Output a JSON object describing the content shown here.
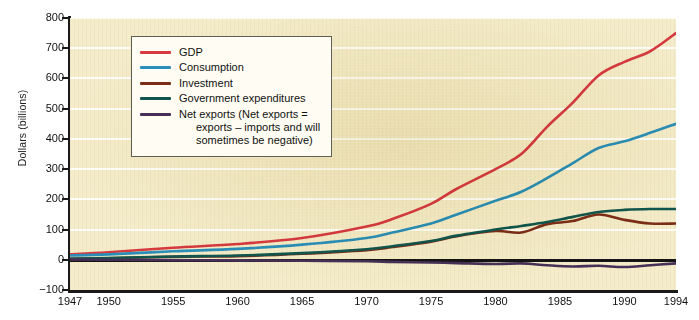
{
  "chart_data": {
    "type": "line",
    "title": "",
    "xlabel": "",
    "ylabel": "Dollars (billions)",
    "xlim": [
      1947,
      1994
    ],
    "ylim": [
      -100,
      800
    ],
    "grid": true,
    "legend_position": "upper-left",
    "x_ticks": [
      "1947",
      "1950",
      "1955",
      "1960",
      "1965",
      "1970",
      "1975",
      "1980",
      "1985",
      "1990",
      "1994"
    ],
    "x_tick_values": [
      1947,
      1950,
      1955,
      1960,
      1965,
      1970,
      1975,
      1980,
      1985,
      1990,
      1994
    ],
    "y_ticks": [
      "800",
      "700",
      "600",
      "500",
      "400",
      "300",
      "200",
      "100",
      "0",
      "-100"
    ],
    "y_tick_values": [
      800,
      700,
      600,
      500,
      400,
      300,
      200,
      100,
      0,
      -100
    ],
    "x": [
      1947,
      1950,
      1955,
      1960,
      1965,
      1970,
      1972,
      1975,
      1977,
      1980,
      1982,
      1984,
      1986,
      1988,
      1990,
      1992,
      1994
    ],
    "series": [
      {
        "name": "GDP",
        "color": "#d63a3f",
        "values": [
          18,
          25,
          40,
          52,
          72,
          110,
          135,
          185,
          235,
          300,
          350,
          440,
          520,
          610,
          655,
          690,
          750
        ]
      },
      {
        "name": "Consumption",
        "color": "#2b8fba",
        "values": [
          14,
          18,
          28,
          36,
          50,
          72,
          90,
          120,
          150,
          195,
          225,
          270,
          320,
          370,
          392,
          420,
          450
        ]
      },
      {
        "name": "Investment",
        "color": "#7c2d16",
        "values": [
          3,
          5,
          10,
          12,
          20,
          32,
          42,
          60,
          78,
          95,
          90,
          118,
          128,
          150,
          132,
          120,
          120
        ]
      },
      {
        "name": "Government expenditures",
        "color": "#11564e",
        "values": [
          3,
          6,
          11,
          14,
          22,
          35,
          45,
          62,
          80,
          100,
          112,
          125,
          142,
          158,
          165,
          168,
          168
        ]
      },
      {
        "name": "Net exports (Net exports = exports – imports and will sometimes be negative)",
        "color": "#463057",
        "values": [
          1,
          0,
          -1,
          -2,
          -3,
          -5,
          -7,
          -9,
          -11,
          -14,
          -12,
          -18,
          -22,
          -20,
          -24,
          -18,
          -12
        ]
      }
    ],
    "legend_entries": [
      {
        "label": "GDP",
        "label_line2": "",
        "color": "#d63a3f"
      },
      {
        "label": "Consumption",
        "label_line2": "",
        "color": "#2b8fba"
      },
      {
        "label": "Investment",
        "label_line2": "",
        "color": "#7c2d16"
      },
      {
        "label": "Government expenditures",
        "label_line2": "",
        "color": "#11564e"
      },
      {
        "label": "Net exports (Net exports =",
        "label_line2": "exports – imports and will\nsometimes be negative)",
        "color": "#463057"
      }
    ]
  },
  "colors": {
    "plot_background": "#f4ecca",
    "gridline": "#ffffff",
    "axis": "#1a1a1a",
    "zero_line": "#141414",
    "legend_background": "#fffdf3",
    "legend_border": "#5f5f52"
  }
}
